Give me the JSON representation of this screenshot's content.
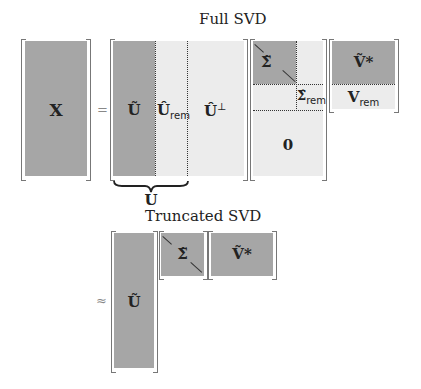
{
  "full_svd": {
    "title": "Full SVD",
    "x_label": "X",
    "equals": "=",
    "u_tilde": "Ũ",
    "u_rem": "Û",
    "u_rem_sub": "rem",
    "u_perp": "Û",
    "u_perp_sup": "⊥",
    "sigma_tilde": "Σ̃",
    "sigma_rem": "Σ̂",
    "sigma_rem_sub": "rem",
    "zero": "0",
    "v_tilde": "Ṽ*",
    "v_rem": "V",
    "v_rem_sub": "rem",
    "brace_label": "U"
  },
  "truncated_svd": {
    "title": "Truncated SVD",
    "approx": "≈",
    "u_tilde": "Ũ",
    "sigma_tilde": "Σ̃",
    "v_tilde": "Ṽ*"
  },
  "colors": {
    "dark": "#a6a6a6",
    "light": "#ececec"
  }
}
